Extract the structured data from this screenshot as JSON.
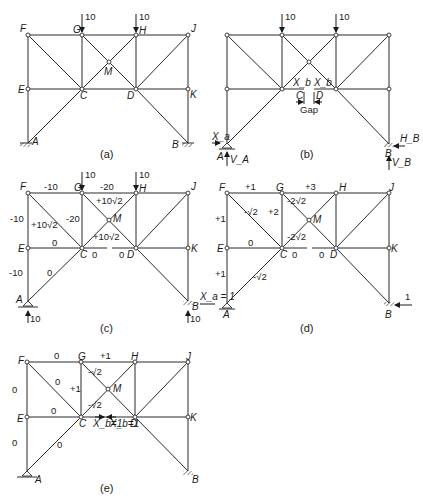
{
  "panels": {
    "a": {
      "caption": "(a)",
      "joints": {
        "F": "F",
        "G": "G",
        "H": "H",
        "J": "J",
        "M": "M",
        "E": "E",
        "C": "C",
        "D": "D",
        "K": "K",
        "A": "A",
        "B": "B"
      },
      "loads": [
        "10",
        "10"
      ]
    },
    "b": {
      "caption": "(b)",
      "loads": [
        "10",
        "10"
      ],
      "gap_label": "Gap",
      "gap_C": "C",
      "gap_D": "D",
      "xb_left": "X_b",
      "xb_right": "X_b",
      "xa": "X_a",
      "A": "A",
      "VA": "V_A",
      "B": "B",
      "VB": "V_B",
      "HB": "H_B"
    },
    "c": {
      "caption": "(c)",
      "loads": [
        "10",
        "10"
      ],
      "reactions": {
        "A": "10",
        "B": "10"
      },
      "xa_label": "X_a = 1",
      "forces": {
        "FG": "-10",
        "GH": "-20",
        "FE": "-10",
        "FC": "+10√2",
        "GC": "-20",
        "GM": "+10√2",
        "MC": "+10√2",
        "EC": "0",
        "CD_left": "0",
        "CD_right": "0",
        "EA": "-10",
        "AC": "0"
      },
      "joints": {
        "F": "F",
        "G": "G",
        "H": "H",
        "J": "J",
        "M": "M",
        "E": "E",
        "C": "C",
        "D": "D",
        "K": "K",
        "A": "A",
        "B": "B"
      }
    },
    "d": {
      "caption": "(d)",
      "unit_load": "1",
      "forces": {
        "FG": "+1",
        "GH": "+3",
        "FE": "+1",
        "FC": "-√2",
        "GC": "+2",
        "GM": "-2√2",
        "MC": "-2√2",
        "EC": "0",
        "CD_left": "0",
        "CD_right": "0",
        "EA": "+1",
        "AC": "-√2"
      },
      "joints": {
        "F": "F",
        "G": "G",
        "H": "H",
        "J": "J",
        "M": "M",
        "E": "E",
        "C": "C",
        "D": "D",
        "K": "K",
        "A": "A",
        "B": "B"
      }
    },
    "e": {
      "caption": "(e)",
      "xb_left": "X_b=1",
      "xb_right": "X_b=1",
      "forces": {
        "FG": "0",
        "GH": "+1",
        "FE": "0",
        "FC": "0",
        "GC": "+1",
        "GM": "-√2",
        "MC": "-√2",
        "EC": "0",
        "EA": "0",
        "AC": "0"
      },
      "joints": {
        "F": "F",
        "G": "G",
        "H": "H",
        "J": "J",
        "M": "M",
        "E": "E",
        "C": "C",
        "D": "D",
        "K": "K",
        "A": "A",
        "B": "B"
      }
    }
  }
}
